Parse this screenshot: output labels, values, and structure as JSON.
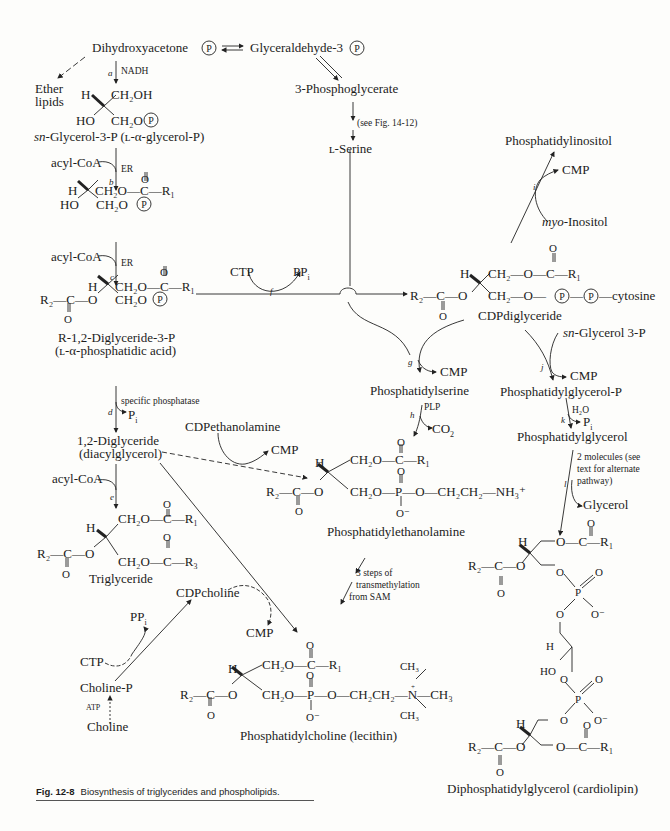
{
  "figure": {
    "caption_label": "Fig. 12-8",
    "caption_text": "Biosynthesis of triglycerides and phospholipids."
  },
  "compounds": {
    "dhap": "Dihydroxyacetone",
    "g3p": "Glyceraldehyde-3",
    "phosphoglycerate": "3-Phosphoglycerate",
    "ether_lipids_1": "Ether",
    "ether_lipids_2": "lipids",
    "glycerol3p": "-Glycerol-3-P (ʟ-α-glycerol-P)",
    "glycerol3p_prefix": "sn",
    "serine": "ʟ-Serine",
    "pa_name": "R-1,2-Diglyceride-3-P",
    "pa_alt": "(ʟ-α-phosphatidic acid)",
    "dag_name": "1,2-Diglyceride",
    "dag_alt": "(diacylglycerol)",
    "triglyceride": "Triglyceride",
    "cdp_diglyceride": "CDPdiglyceride",
    "phosphatidylinositol": "Phosphatidylinositol",
    "myo_inositol_prefix": "myo",
    "myo_inositol": "-Inositol",
    "ps": "Phosphatidylserine",
    "pe": "Phosphatidylethanolamine",
    "pc": "Phosphatidylcholine (lecithin)",
    "pgp": "Phosphatidylglycerol-P",
    "pg": "Phosphatidylglycerol",
    "sn_glycerol_3p_prefix": "sn",
    "sn_glycerol_3p": "-Glycerol 3-P",
    "glycerol": "Glycerol",
    "cardiolipin": "Diphosphatidylglycerol (cardiolipin)",
    "cdp_ethanolamine": "CDPethanolamine",
    "cdp_choline": "CDPcholine",
    "choline_p": "Choline-P",
    "choline": "Choline"
  },
  "reagents": {
    "nadh": "NADH",
    "acyl_coa": "acyl-CoA",
    "er": "ER",
    "ctp": "CTP",
    "ppi": "PP",
    "cmp": "CMP",
    "pi": "P",
    "co2": "CO",
    "plp": "PLP",
    "h2o": "H₂O",
    "atp": "ATP",
    "specific_phosphatase": "specific phosphatase",
    "see_fig": "(see Fig. 14-12)",
    "two_molecules": [
      "2 molecules (see",
      "text for alternate",
      "pathway)"
    ],
    "transmethylation": [
      "3 steps of",
      "transmethylation",
      "from SAM"
    ]
  },
  "reaction_labels": [
    "a",
    "b",
    "c",
    "d",
    "e",
    "f",
    "g",
    "h",
    "i",
    "j",
    "k",
    "l"
  ],
  "atoms": {
    "P": "P",
    "H": "H",
    "HO": "HO",
    "O": "O",
    "Ominus": "O⁻",
    "CH2OH": "CH₂OH",
    "CH2O": "CH₂O",
    "CH2": "CH₂",
    "C": "C",
    "R1": "R₁",
    "R2": "R₂",
    "R3": "R₃",
    "cytosine": "cytosine",
    "CH2CH2": "CH₂CH₂",
    "NH3": "NH₃⁺",
    "N": "N",
    "CH3": "CH₃",
    "plus": "+"
  }
}
